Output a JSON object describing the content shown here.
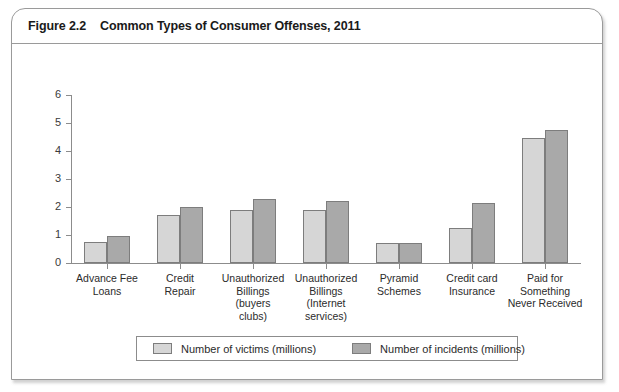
{
  "figure": {
    "label": "Figure 2.2",
    "caption": "Common Types of Consumer Offenses, 2011"
  },
  "chart_data": {
    "type": "bar",
    "title": "Common Types of Consumer Offenses, 2011",
    "xlabel": "",
    "ylabel": "",
    "ylim": [
      0,
      6
    ],
    "yticks": [
      0,
      1,
      2,
      3,
      4,
      5,
      6
    ],
    "grid": false,
    "legend_position": "bottom",
    "categories": [
      "Advance Fee\nLoans",
      "Credit\nRepair",
      "Unauthorized\nBillings\n(buyers\nclubs)",
      "Unauthorized\nBillings\n(Internet\nservices)",
      "Pyramid\nSchemes",
      "Credit card\nInsurance",
      "Paid for\nSomething\nNever Received"
    ],
    "series": [
      {
        "name": "Number of victims (millions)",
        "color": "#d6d6d6",
        "values": [
          0.75,
          1.7,
          1.9,
          1.9,
          0.7,
          1.25,
          4.45
        ]
      },
      {
        "name": "Number of incidents (millions)",
        "color": "#a9a9a9",
        "values": [
          0.95,
          2.0,
          2.3,
          2.2,
          0.7,
          2.15,
          4.75
        ]
      }
    ]
  }
}
